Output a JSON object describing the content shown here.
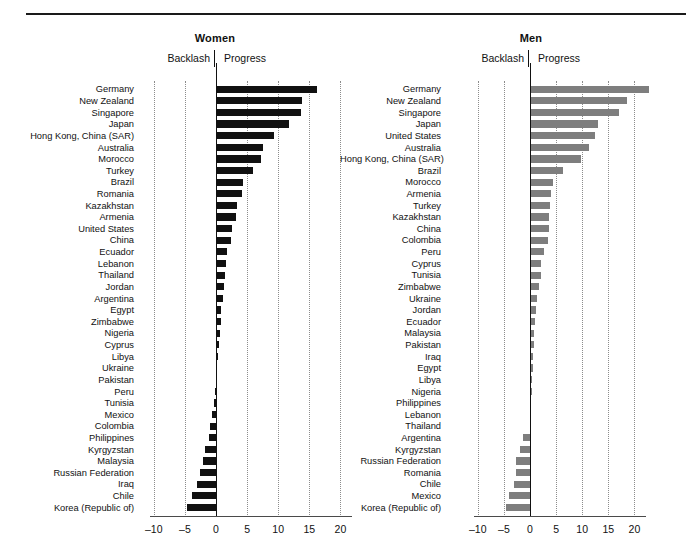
{
  "figure": {
    "panels": [
      {
        "id": "women",
        "title": "Women",
        "backlash_label": "Backlash",
        "progress_label": "Progress",
        "bar_color": "#111111"
      },
      {
        "id": "men",
        "title": "Men",
        "backlash_label": "Backlash",
        "progress_label": "Progress",
        "bar_color": "#7e7e7e"
      }
    ]
  },
  "chart_data": [
    {
      "type": "bar",
      "orientation": "horizontal",
      "title": "Women",
      "xlabel": "",
      "ylabel": "",
      "xlim": [
        -10,
        20
      ],
      "xticks": [
        -10,
        -5,
        0,
        5,
        10,
        15,
        20
      ],
      "xtick_labels": [
        "–10",
        "–5",
        "0",
        "5",
        "10",
        "15",
        "20"
      ],
      "grid": true,
      "legend": false,
      "annotations": [
        "Backlash",
        "Progress"
      ],
      "bar_color": "#111111",
      "categories": [
        "Germany",
        "New Zealand",
        "Singapore",
        "Japan",
        "Hong Kong, China (SAR)",
        "Australia",
        "Morocco",
        "Turkey",
        "Brazil",
        "Romania",
        "Kazakhstan",
        "Armenia",
        "United States",
        "China",
        "Ecuador",
        "Lebanon",
        "Thailand",
        "Jordan",
        "Argentina",
        "Egypt",
        "Zimbabwe",
        "Nigeria",
        "Cyprus",
        "Libya",
        "Ukraine",
        "Pakistan",
        "Peru",
        "Tunisia",
        "Mexico",
        "Colombia",
        "Philippines",
        "Kyrgyzstan",
        "Malaysia",
        "Russian Federation",
        "Iraq",
        "Chile",
        "Korea (Republic of)"
      ],
      "values": [
        16.0,
        13.6,
        13.5,
        11.6,
        9.1,
        7.4,
        7.0,
        5.8,
        4.2,
        4.0,
        3.2,
        3.1,
        2.4,
        2.3,
        1.6,
        1.4,
        1.3,
        1.1,
        0.9,
        0.7,
        0.6,
        0.5,
        0.4,
        0.2,
        0.0,
        0.0,
        -0.2,
        -0.4,
        -0.6,
        -0.9,
        -1.2,
        -1.7,
        -2.1,
        -2.6,
        -3.1,
        -3.9,
        -4.6
      ]
    },
    {
      "type": "bar",
      "orientation": "horizontal",
      "title": "Men",
      "xlabel": "",
      "ylabel": "",
      "xlim": [
        -10,
        23
      ],
      "xticks": [
        -10,
        -5,
        0,
        5,
        10,
        15,
        20
      ],
      "xtick_labels": [
        "–10",
        "–5",
        "0",
        "5",
        "10",
        "15",
        "20"
      ],
      "grid": true,
      "legend": false,
      "annotations": [
        "Backlash",
        "Progress"
      ],
      "bar_color": "#7e7e7e",
      "categories": [
        "Germany",
        "New Zealand",
        "Singapore",
        "Japan",
        "United States",
        "Australia",
        "Hong Kong, China (SAR)",
        "Brazil",
        "Morocco",
        "Armenia",
        "Turkey",
        "Kazakhstan",
        "China",
        "Colombia",
        "Peru",
        "Cyprus",
        "Tunisia",
        "Zimbabwe",
        "Ukraine",
        "Jordan",
        "Ecuador",
        "Malaysia",
        "Pakistan",
        "Iraq",
        "Egypt",
        "Libya",
        "Nigeria",
        "Philippines",
        "Lebanon",
        "Thailand",
        "Argentina",
        "Kyrgyzstan",
        "Russian Federation",
        "Romania",
        "Chile",
        "Mexico",
        "Korea (Republic of)"
      ],
      "values": [
        22.7,
        18.3,
        16.9,
        12.9,
        12.3,
        11.1,
        9.6,
        6.1,
        4.2,
        3.9,
        3.6,
        3.5,
        3.4,
        3.3,
        2.4,
        2.0,
        1.9,
        1.6,
        1.2,
        0.9,
        0.7,
        0.6,
        0.5,
        0.4,
        0.3,
        0.2,
        0.1,
        0.0,
        0.0,
        0.0,
        -1.4,
        -1.9,
        -2.6,
        -2.7,
        -3.0,
        -4.1,
        -4.6
      ]
    }
  ]
}
